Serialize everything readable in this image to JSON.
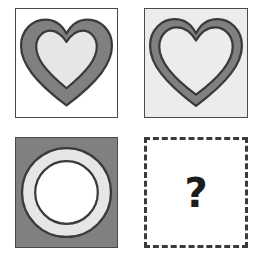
{
  "puzzle": {
    "type": "visual-analogy-matrix",
    "rows": 2,
    "columns": 2,
    "question_mark": "?",
    "palette": {
      "white": "#ffffff",
      "light_gray": "#e6e6e6",
      "panel_light_bg": "#ececec",
      "mid_gray": "#808080",
      "dark_outline": "#3a3a3a",
      "panel_border": "#4a4a4a"
    },
    "cells": [
      {
        "id": "cell-1",
        "position": "top-left",
        "shape": "heart",
        "border_style": "solid",
        "background": "#ffffff",
        "ring_color": "#808080",
        "ring_thickness": "thick",
        "inner_fill": "#e6e6e6",
        "outline_color": "#3a3a3a",
        "label": "heart with thick gray ring on white background"
      },
      {
        "id": "cell-2",
        "position": "top-right",
        "shape": "heart",
        "border_style": "solid",
        "background": "#ececec",
        "ring_color": "#808080",
        "ring_thickness": "thin",
        "inner_fill": "#ececec",
        "outline_color": "#3a3a3a",
        "label": "heart with thin gray ring on light gray background"
      },
      {
        "id": "cell-3",
        "position": "bottom-left",
        "shape": "circle",
        "border_style": "solid",
        "background": "#808080",
        "ring_color": "#e6e6e6",
        "ring_thickness": "thick",
        "inner_fill": "#ffffff",
        "outline_color": "#3a3a3a",
        "label": "circle with thick light ring on dark gray background"
      },
      {
        "id": "cell-4",
        "position": "bottom-right",
        "shape": "unknown",
        "border_style": "dashed",
        "background": "#ffffff",
        "content": "?",
        "label": "missing answer cell marked with a question mark"
      }
    ]
  }
}
